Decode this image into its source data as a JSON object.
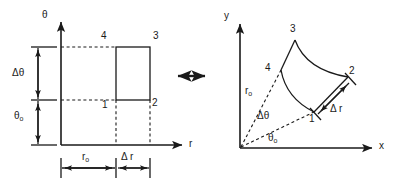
{
  "figure": {
    "caption_none": "",
    "equivalence_arrow": "double-headed-arrow"
  },
  "left_panel": {
    "name": "cartesian-r-theta-plane",
    "axes": {
      "vertical_label": "θ",
      "horizontal_label": "r"
    },
    "corner_labels": {
      "c1": "1",
      "c2": "2",
      "c3": "3",
      "c4": "4"
    },
    "dimensions": {
      "delta_theta": "Δθ",
      "theta_o_base": "θ",
      "theta_o_sub": "o",
      "r_o_base": "r",
      "r_o_sub": "o",
      "delta_r": "Δ r"
    }
  },
  "right_panel": {
    "name": "polar-physical-plane",
    "axes": {
      "vertical_label": "y",
      "horizontal_label": "x"
    },
    "corner_labels": {
      "c1": "1",
      "c2": "2",
      "c3": "3",
      "c4": "4"
    },
    "dimensions": {
      "r_o_base": "r",
      "r_o_sub": "o",
      "delta_theta": "Δθ",
      "theta_o_base": "θ",
      "theta_o_sub": "o",
      "delta_r": "Δ r"
    }
  },
  "colors": {
    "line": "#1a1a1a",
    "dashed": "#1a1a1a",
    "background": "#ffffff"
  }
}
